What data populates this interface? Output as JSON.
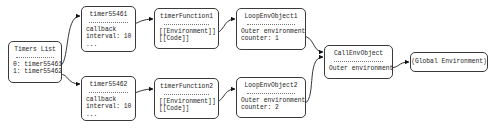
{
  "diagram": {
    "type": "object-reference-graph",
    "nodes": {
      "timers_list": {
        "title": "Timers List",
        "lines": [
          "0: timer55461",
          "1: timer55462"
        ]
      },
      "timer1": {
        "title": "timer55461",
        "lines": [
          "callback",
          "interval: 10",
          "..."
        ]
      },
      "timer2": {
        "title": "timer55462",
        "lines": [
          "callback",
          "interval: 10",
          "..."
        ]
      },
      "func1": {
        "title": "timerFunction1",
        "lines": [
          "[[Environment]]",
          "[[Code]]"
        ]
      },
      "func2": {
        "title": "timerFunction2",
        "lines": [
          "[[Environment]]",
          "[[Code]]"
        ]
      },
      "loop1": {
        "title": "LoopEnvObject1",
        "lines": [
          "Outer environment",
          "counter: 1"
        ]
      },
      "loop2": {
        "title": "LoopEnvObject2",
        "lines": [
          "Outer environment",
          "counter: 2"
        ]
      },
      "callenv": {
        "title": "CallEnvObject",
        "lines": [
          "Outer environment"
        ]
      },
      "global": {
        "title": "(Global Environment)"
      }
    },
    "edges": [
      {
        "from": "timers_list.0",
        "to": "timer1"
      },
      {
        "from": "timers_list.1",
        "to": "timer2"
      },
      {
        "from": "timer1.callback",
        "to": "func1"
      },
      {
        "from": "timer2.callback",
        "to": "func2"
      },
      {
        "from": "func1.[[Environment]]",
        "to": "loop1"
      },
      {
        "from": "func2.[[Environment]]",
        "to": "loop2"
      },
      {
        "from": "loop1.Outer environment",
        "to": "callenv"
      },
      {
        "from": "loop2.Outer environment",
        "to": "callenv"
      },
      {
        "from": "callenv.Outer environment",
        "to": "global"
      }
    ]
  }
}
